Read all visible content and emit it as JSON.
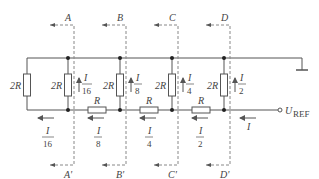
{
  "diagram": {
    "type": "R-2R ladder DAC network",
    "colors": {
      "wire": "#555555",
      "dashed": "#888888",
      "text": "#444444"
    },
    "cut_lines": [
      {
        "top": "A",
        "bottom": "A'"
      },
      {
        "top": "B",
        "bottom": "B'"
      },
      {
        "top": "C",
        "bottom": "C'"
      },
      {
        "top": "D",
        "bottom": "D'"
      }
    ],
    "resistors": {
      "shunt_terminal": "2R",
      "shunt": [
        "2R",
        "2R",
        "2R",
        "2R"
      ],
      "series": [
        "R",
        "R",
        "R"
      ]
    },
    "shunt_currents": [
      {
        "num": "I",
        "den": "16"
      },
      {
        "num": "I",
        "den": "8"
      },
      {
        "num": "I",
        "den": "4"
      },
      {
        "num": "I",
        "den": "2"
      }
    ],
    "bottom_currents": [
      {
        "num": "I",
        "den": "16"
      },
      {
        "num": "I",
        "den": "8"
      },
      {
        "num": "I",
        "den": "4"
      },
      {
        "num": "I",
        "den": "2"
      }
    ],
    "input_current": "I",
    "reference": {
      "symbol": "U",
      "subscript": "REF"
    }
  }
}
